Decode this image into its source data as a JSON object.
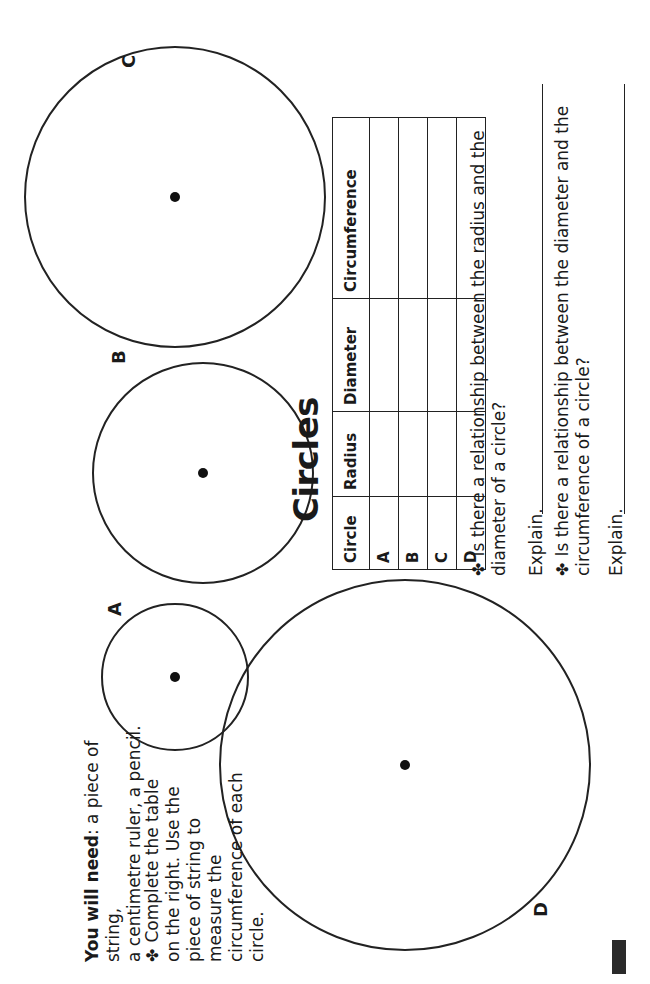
{
  "title": "Circles",
  "materials": {
    "label": "You will need",
    "text_line1": ": a piece of string,",
    "text_line2": "a centimetre ruler, a pencil."
  },
  "instruction": {
    "bullet_icon": "✤",
    "lines": [
      "Complete the table",
      "on the right. Use the",
      "piece of string to",
      "measure the",
      "circumference of each circle."
    ]
  },
  "circles": [
    {
      "label": "A"
    },
    {
      "label": "B"
    },
    {
      "label": "C"
    },
    {
      "label": "D"
    }
  ],
  "table": {
    "headers": [
      "Circle",
      "Radius",
      "Diameter",
      "Circumference"
    ],
    "rows": [
      {
        "circle": "A",
        "radius": "",
        "diameter": "",
        "circumference": ""
      },
      {
        "circle": "B",
        "radius": "",
        "diameter": "",
        "circumference": ""
      },
      {
        "circle": "C",
        "radius": "",
        "diameter": "",
        "circumference": ""
      },
      {
        "circle": "D",
        "radius": "",
        "diameter": "",
        "circumference": ""
      }
    ]
  },
  "questions": [
    {
      "bullet_icon": "✤",
      "line1": "Is there a relationship between the radius and the",
      "line2": "diameter of a circle?",
      "explain_label": "Explain.",
      "answer": ""
    },
    {
      "bullet_icon": "✤",
      "line1": "Is there a relationship between the diameter and the",
      "line2": "circumference of a circle?",
      "explain_label": "Explain.",
      "answer": ""
    }
  ]
}
